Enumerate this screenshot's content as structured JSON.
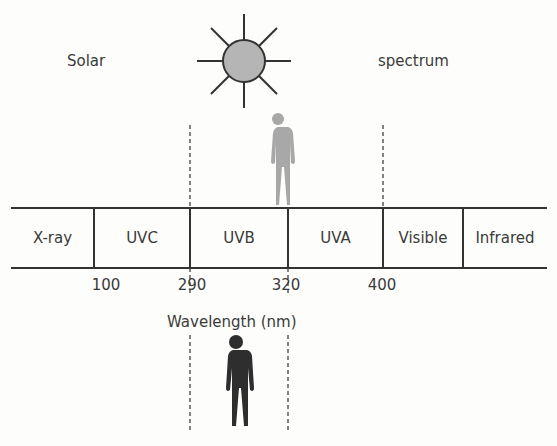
{
  "title": {
    "left": "Solar",
    "right": "spectrum"
  },
  "bands": [
    {
      "label": "X-ray",
      "from": 11,
      "to": 94
    },
    {
      "label": "UVC",
      "from": 94,
      "to": 190
    },
    {
      "label": "UVB",
      "from": 190,
      "to": 288
    },
    {
      "label": "UVA",
      "from": 288,
      "to": 383
    },
    {
      "label": "Visible",
      "from": 383,
      "to": 463
    },
    {
      "label": "Infrared",
      "from": 463,
      "to": 547
    }
  ],
  "ticks": [
    {
      "value": "100",
      "x": 106
    },
    {
      "value": "290",
      "x": 192
    },
    {
      "value": "320",
      "x": 286
    },
    {
      "value": "400",
      "x": 382
    }
  ],
  "axis_label": "Wavelength (nm)",
  "icons": {
    "sun": "sun-icon",
    "top_person": "person-gray-icon",
    "bottom_person": "person-dark-icon"
  },
  "colors": {
    "sun_fill": "#b5b5b5",
    "person_gray": "#a8a8a8",
    "person_dark": "#2e2e2e",
    "line": "#333333"
  }
}
